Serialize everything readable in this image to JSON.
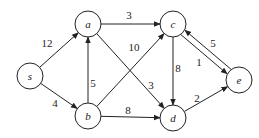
{
  "nodes": [
    {
      "id": "s",
      "label": "s",
      "x": 30,
      "y": 76
    },
    {
      "id": "a",
      "label": "a",
      "x": 88,
      "y": 24
    },
    {
      "id": "b",
      "label": "b",
      "x": 88,
      "y": 116
    },
    {
      "id": "c",
      "label": "c",
      "x": 173,
      "y": 24
    },
    {
      "id": "d",
      "label": "d",
      "x": 173,
      "y": 118
    },
    {
      "id": "e",
      "label": "e",
      "x": 239,
      "y": 80
    }
  ],
  "edges": [
    {
      "from": "s",
      "to": "a",
      "weight": "12",
      "lx": 47,
      "ly": 47
    },
    {
      "from": "s",
      "to": "b",
      "weight": "4",
      "lx": 55,
      "ly": 107
    },
    {
      "from": "b",
      "to": "a",
      "weight": "5",
      "lx": 93,
      "ly": 87
    },
    {
      "from": "a",
      "to": "c",
      "weight": "3",
      "lx": 129,
      "ly": 19
    },
    {
      "from": "a",
      "to": "d",
      "weight": "3",
      "lx": 151,
      "ly": 89
    },
    {
      "from": "b",
      "to": "c",
      "weight": "10",
      "lx": 134,
      "ly": 51
    },
    {
      "from": "b",
      "to": "d",
      "weight": "8",
      "lx": 128,
      "ly": 114
    },
    {
      "from": "c",
      "to": "d",
      "weight": "8",
      "lx": 178,
      "ly": 72
    },
    {
      "from": "c",
      "to": "e",
      "weight": "5",
      "lx": 213,
      "ly": 47
    },
    {
      "from": "e",
      "to": "c",
      "weight": "1",
      "lx": 199,
      "ly": 66
    },
    {
      "from": "d",
      "to": "e",
      "weight": "2",
      "lx": 197,
      "ly": 102
    }
  ]
}
